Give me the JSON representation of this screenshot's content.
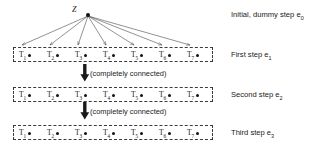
{
  "figure": {
    "root": {
      "label": "Z",
      "name": "root-node-z"
    },
    "captions": [
      {
        "text": "Initial, dummy step e",
        "sub": "0"
      },
      {
        "text": "First step e",
        "sub": "1"
      },
      {
        "text": "Second step e",
        "sub": "2"
      },
      {
        "text": "Third step e",
        "sub": "3"
      }
    ],
    "connector_note": "(completely connected)",
    "node_base": "T",
    "node_subscripts": [
      "1",
      "2",
      "3",
      "4",
      "5",
      "6",
      "7"
    ],
    "rows": [
      {
        "id": "first-step-row",
        "nodes": [
          {
            "label": "T",
            "sub": "1"
          },
          {
            "label": "T",
            "sub": "2"
          },
          {
            "label": "T",
            "sub": "3"
          },
          {
            "label": "T",
            "sub": "4"
          },
          {
            "label": "T",
            "sub": "5"
          },
          {
            "label": "T",
            "sub": "6"
          },
          {
            "label": "T",
            "sub": "7"
          }
        ]
      },
      {
        "id": "second-step-row",
        "nodes": [
          {
            "label": "T",
            "sub": "1"
          },
          {
            "label": "T",
            "sub": "2"
          },
          {
            "label": "T",
            "sub": "3"
          },
          {
            "label": "T",
            "sub": "4"
          },
          {
            "label": "T",
            "sub": "5"
          },
          {
            "label": "T",
            "sub": "6"
          },
          {
            "label": "T",
            "sub": "7"
          }
        ]
      },
      {
        "id": "third-step-row",
        "nodes": [
          {
            "label": "T",
            "sub": "1"
          },
          {
            "label": "T",
            "sub": "2"
          },
          {
            "label": "T",
            "sub": "3"
          },
          {
            "label": "T",
            "sub": "4"
          },
          {
            "label": "T",
            "sub": "5"
          },
          {
            "label": "T",
            "sub": "6"
          },
          {
            "label": "T",
            "sub": "7"
          }
        ]
      }
    ],
    "colors": {
      "ink": "#1a1a1a",
      "dash": "#3a3a3a",
      "edge": "#4a4a4a",
      "background": "#ffffff"
    },
    "layout": {
      "row_left": 13,
      "row_width": 200,
      "node_x": [
        5,
        33,
        61,
        89,
        117,
        145,
        173
      ],
      "root_x": 88,
      "root_y": 15,
      "row_tops": [
        47,
        87,
        125
      ]
    }
  }
}
